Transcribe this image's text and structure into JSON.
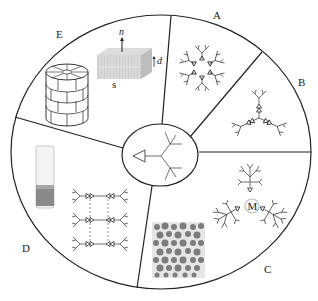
{
  "diagram": {
    "layout": "circular, five sectors around central dendron",
    "colors": {
      "stroke": "#222222",
      "background": "#ffffff",
      "lamella": "#c8c8c8",
      "vial_liquid": "#8a8a8a",
      "micrograph_dot": "#6a6a6a",
      "metal_ring": "#bdbdbd"
    },
    "center": {
      "label": "",
      "description": "dendron with triangular focal group",
      "icon": "dendron-icon"
    },
    "sectors": [
      {
        "id": "A",
        "label": "A",
        "description": "hexameric dendron assembly (six dendrons, triangles pointing inward)"
      },
      {
        "id": "B",
        "label": "B",
        "description": "three dendrons attached to a trifunctional core"
      },
      {
        "id": "C",
        "label": "C",
        "description": "three dendrons coordinated to a metal center",
        "core_label": "M",
        "inset": "micrograph of spherical particles"
      },
      {
        "id": "D",
        "label": "D",
        "description": "hydrogen-bonded dendron network",
        "inset": "gel in vial"
      },
      {
        "id": "E",
        "label": "E",
        "description": "columnar and lamellar liquid-crystalline phases",
        "annotations": {
          "normal": "n",
          "spacing": "d",
          "substrate": "s"
        }
      }
    ]
  }
}
